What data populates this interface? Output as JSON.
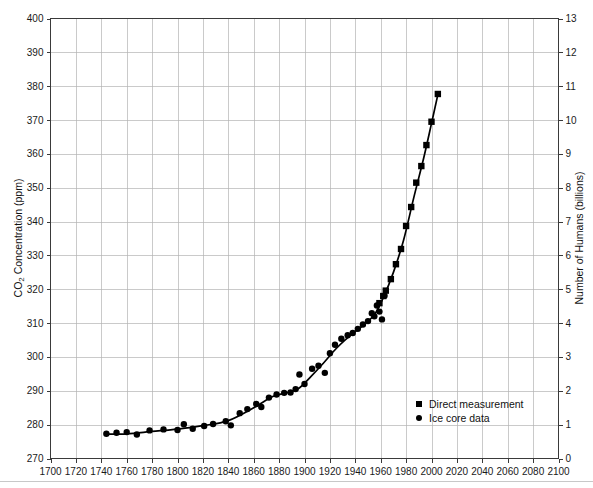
{
  "chart_data": {
    "type": "scatter",
    "title": "",
    "subtitle": "",
    "xlabel": "",
    "ylabel": "CO2 Concentration (ppm)",
    "ylabel_display": "CO₂ Concentration (ppm)",
    "y2label": "Number of Humans (billions)",
    "xlim": [
      1700,
      2100
    ],
    "ylim": [
      270,
      400
    ],
    "y2lim": [
      0,
      13
    ],
    "xticks": [
      1700,
      1720,
      1740,
      1760,
      1780,
      1800,
      1820,
      1840,
      1860,
      1880,
      1900,
      1920,
      1940,
      1960,
      1980,
      2000,
      2020,
      2040,
      2060,
      2080,
      2100
    ],
    "yticks": [
      270,
      280,
      290,
      300,
      310,
      320,
      330,
      340,
      350,
      360,
      370,
      380,
      390,
      400
    ],
    "y2ticks": [
      0,
      1,
      2,
      3,
      4,
      5,
      6,
      7,
      8,
      9,
      10,
      11,
      12,
      13
    ],
    "grid": true,
    "legend_position": "center-right-lower",
    "legend": [
      {
        "label": "Direct measurement",
        "marker": "square",
        "color": "#000000"
      },
      {
        "label": "Ice core data",
        "marker": "circle",
        "color": "#000000"
      }
    ],
    "series": [
      {
        "name": "Ice core data",
        "marker": "circle",
        "color": "#000000",
        "points": [
          [
            1744,
            277.3
          ],
          [
            1752,
            277.6
          ],
          [
            1760,
            277.8
          ],
          [
            1768,
            277.1
          ],
          [
            1778,
            278.3
          ],
          [
            1789,
            278.6
          ],
          [
            1800,
            278.4
          ],
          [
            1805,
            280.1
          ],
          [
            1812,
            278.8
          ],
          [
            1821,
            279.6
          ],
          [
            1828,
            280.2
          ],
          [
            1838,
            281.0
          ],
          [
            1842,
            279.8
          ],
          [
            1849,
            283.4
          ],
          [
            1855,
            284.6
          ],
          [
            1862,
            286.1
          ],
          [
            1866,
            285.2
          ],
          [
            1872,
            288.0
          ],
          [
            1878,
            288.9
          ],
          [
            1884,
            289.4
          ],
          [
            1889,
            289.5
          ],
          [
            1893,
            290.5
          ],
          [
            1896,
            294.8
          ],
          [
            1900,
            292.0
          ],
          [
            1906,
            296.5
          ],
          [
            1911,
            297.4
          ],
          [
            1916,
            295.3
          ],
          [
            1920,
            301.1
          ],
          [
            1924,
            303.6
          ],
          [
            1929,
            305.4
          ],
          [
            1934,
            306.4
          ],
          [
            1938,
            307.1
          ],
          [
            1942,
            308.3
          ],
          [
            1946,
            309.6
          ],
          [
            1950,
            310.6
          ],
          [
            1953,
            312.9
          ],
          [
            1955,
            312.0
          ],
          [
            1957,
            315.2
          ],
          [
            1959,
            313.4
          ],
          [
            1961,
            311.1
          ],
          [
            1963,
            318.1
          ]
        ]
      },
      {
        "name": "Direct measurement",
        "marker": "square",
        "color": "#000000",
        "points": [
          [
            1959,
            315.9
          ],
          [
            1962,
            318.0
          ],
          [
            1964,
            319.6
          ],
          [
            1968,
            323.0
          ],
          [
            1972,
            327.4
          ],
          [
            1976,
            331.9
          ],
          [
            1980,
            338.7
          ],
          [
            1984,
            344.3
          ],
          [
            1988,
            351.5
          ],
          [
            1992,
            356.4
          ],
          [
            1996,
            362.6
          ],
          [
            2000,
            369.5
          ],
          [
            2005,
            377.7
          ]
        ]
      }
    ],
    "trend": [
      [
        1744,
        277.2
      ],
      [
        1760,
        277.3
      ],
      [
        1780,
        278.0
      ],
      [
        1800,
        278.7
      ],
      [
        1820,
        279.7
      ],
      [
        1840,
        281.2
      ],
      [
        1860,
        285.0
      ],
      [
        1875,
        288.3
      ],
      [
        1885,
        289.3
      ],
      [
        1895,
        290.6
      ],
      [
        1905,
        294.2
      ],
      [
        1915,
        298.2
      ],
      [
        1925,
        302.5
      ],
      [
        1935,
        306.0
      ],
      [
        1945,
        309.0
      ],
      [
        1955,
        312.5
      ],
      [
        1962,
        317.5
      ],
      [
        1970,
        325.0
      ],
      [
        1978,
        334.5
      ],
      [
        1986,
        347.0
      ],
      [
        1994,
        359.0
      ],
      [
        2000,
        369.0
      ],
      [
        2005,
        377.5
      ]
    ]
  }
}
